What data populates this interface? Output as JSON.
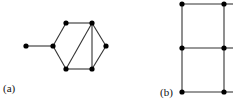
{
  "figure": {
    "colors": {
      "edge": "#333333",
      "node": "#000000",
      "background": "#ffffff"
    },
    "panels": [
      {
        "label": "(a)",
        "label_pos": [
          3,
          92
        ],
        "nodes": [
          {
            "id": "p",
            "x": 26,
            "y": 46
          },
          {
            "id": "a",
            "x": 53,
            "y": 46
          },
          {
            "id": "b",
            "x": 66,
            "y": 23
          },
          {
            "id": "c",
            "x": 92,
            "y": 23
          },
          {
            "id": "d",
            "x": 106,
            "y": 46
          },
          {
            "id": "e",
            "x": 92,
            "y": 69
          },
          {
            "id": "f",
            "x": 66,
            "y": 69
          }
        ],
        "edges": [
          [
            "p",
            "a"
          ],
          [
            "a",
            "b"
          ],
          [
            "b",
            "c"
          ],
          [
            "c",
            "d"
          ],
          [
            "d",
            "e"
          ],
          [
            "e",
            "f"
          ],
          [
            "f",
            "a"
          ],
          [
            "c",
            "f"
          ],
          [
            "c",
            "e"
          ]
        ]
      },
      {
        "label": "(b)",
        "label_pos": [
          160,
          96
        ],
        "nodes": [
          {
            "id": "g1",
            "x": 182,
            "y": 4
          },
          {
            "id": "g2",
            "x": 224,
            "y": 4
          },
          {
            "id": "g3",
            "x": 182,
            "y": 48
          },
          {
            "id": "g4",
            "x": 224,
            "y": 48
          },
          {
            "id": "g5",
            "x": 182,
            "y": 92
          },
          {
            "id": "g6",
            "x": 224,
            "y": 92
          }
        ],
        "edges": [
          [
            "g1",
            "g2"
          ],
          [
            "g3",
            "g4"
          ],
          [
            "g5",
            "g6"
          ],
          [
            "g1",
            "g3"
          ],
          [
            "g3",
            "g5"
          ],
          [
            "g2",
            "g4"
          ],
          [
            "g4",
            "g6"
          ]
        ],
        "open_edges": [
          {
            "x1": 224,
            "y1": 4,
            "x2": 233,
            "y2": 4
          },
          {
            "x1": 224,
            "y1": 48,
            "x2": 233,
            "y2": 48
          },
          {
            "x1": 224,
            "y1": 92,
            "x2": 233,
            "y2": 92
          }
        ]
      }
    ]
  }
}
